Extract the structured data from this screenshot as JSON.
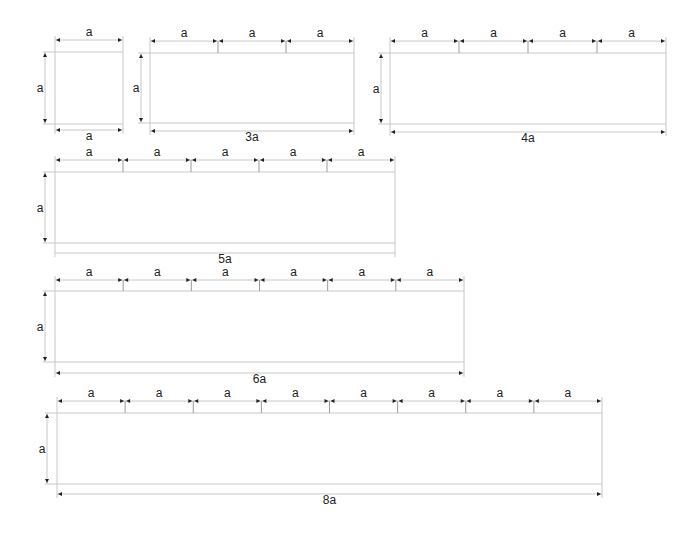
{
  "colors": {
    "line": "#c8c8c8",
    "arrow": "#222222",
    "text": "#222222",
    "tick": "#9a9a9a"
  },
  "unit_label": "a",
  "figures": [
    {
      "id": "fig-1a",
      "n": 1,
      "x0": 55,
      "x1": 123,
      "dimTop": 40,
      "top": 52,
      "bottom": 124,
      "dimBottom": 130,
      "vdimX": 45,
      "bottomLabel": "a",
      "bottomArrows": true,
      "showSegments": false
    },
    {
      "id": "fig-3a",
      "n": 3,
      "x0": 150,
      "x1": 354,
      "dimTop": 41,
      "top": 53,
      "bottom": 123,
      "dimBottom": 131,
      "vdimX": 141,
      "bottomLabel": "3a",
      "bottomArrows": true,
      "showSegments": true
    },
    {
      "id": "fig-4a",
      "n": 4,
      "x0": 390,
      "x1": 666,
      "dimTop": 41,
      "top": 53,
      "bottom": 124,
      "dimBottom": 132,
      "vdimX": 381,
      "bottomLabel": "4a",
      "bottomArrows": true,
      "showSegments": true
    },
    {
      "id": "fig-5a",
      "n": 5,
      "x0": 55,
      "x1": 395,
      "dimTop": 160,
      "top": 172,
      "bottom": 243,
      "dimBottom": 253,
      "vdimX": 45,
      "bottomLabel": "5a",
      "bottomArrows": false,
      "showSegments": true
    },
    {
      "id": "fig-6a",
      "n": 6,
      "x0": 55,
      "x1": 464,
      "dimTop": 280,
      "top": 291,
      "bottom": 362,
      "dimBottom": 373,
      "vdimX": 45,
      "bottomLabel": "6a",
      "bottomArrows": true,
      "showSegments": true
    },
    {
      "id": "fig-8a",
      "n": 8,
      "x0": 57,
      "x1": 602,
      "dimTop": 401,
      "top": 413,
      "bottom": 484,
      "dimBottom": 494,
      "vdimX": 47,
      "bottomLabel": "8a",
      "bottomArrows": true,
      "showSegments": true
    }
  ]
}
